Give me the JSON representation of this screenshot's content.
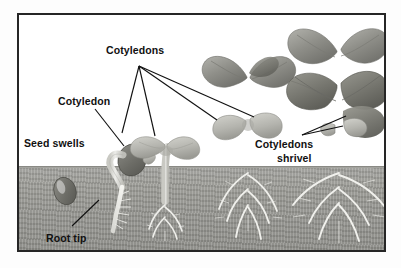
{
  "figure": {
    "frame": {
      "border_color": "#262626"
    },
    "colors": {
      "sky": "#ffffff",
      "soil": "#9d9d98",
      "leader_line": "#111111",
      "label_text": "#111111",
      "seed_dark": "#6f6f6a",
      "cotyledon": "#b9b9b3",
      "stem": "#e6e6e2",
      "leaf": "#9e9e98",
      "root": "#f2f2ee"
    },
    "soil_line_y": 152
  },
  "labels": [
    {
      "id": "cotyledons-top",
      "text": "Cotyledons",
      "x": 104,
      "y": 42,
      "lines": 1
    },
    {
      "id": "cotyledon-single",
      "text": "Cotyledon",
      "x": 56,
      "y": 93,
      "lines": 1
    },
    {
      "id": "seed-swells",
      "text": "Seed swells",
      "x": 22,
      "y": 135,
      "lines": 1
    },
    {
      "id": "root-tip",
      "text": "Root tip",
      "x": 44,
      "y": 230,
      "lines": 1
    },
    {
      "id": "cotyledons-shrivel",
      "text": "Cotyledons",
      "x": 253,
      "y": 136,
      "lines": 1
    },
    {
      "id": "shrivel",
      "text": "shrivel",
      "x": 275,
      "y": 150,
      "lines": 1
    }
  ],
  "leader_lines": [
    {
      "id": "cotyledons-to-stage3-left",
      "from": [
        137,
        64
      ],
      "to": [
        120,
        131
      ]
    },
    {
      "id": "cotyledons-to-stage3-right",
      "from": [
        137,
        64
      ],
      "to": [
        153,
        134
      ]
    },
    {
      "id": "cotyledons-to-stage4-left",
      "from": [
        137,
        64
      ],
      "to": [
        215,
        118
      ]
    },
    {
      "id": "cotyledons-to-stage4-right",
      "from": [
        137,
        64
      ],
      "to": [
        252,
        115
      ]
    },
    {
      "id": "cotyledon-to-seed",
      "from": [
        93,
        107
      ],
      "to": [
        122,
        144
      ]
    },
    {
      "id": "root-tip-to-root",
      "from": [
        70,
        224
      ],
      "to": [
        97,
        198
      ]
    },
    {
      "id": "shrivel-to-cotyledon-upper",
      "from": [
        300,
        133
      ],
      "to": [
        344,
        114
      ]
    },
    {
      "id": "shrivel-to-cotyledon-lower",
      "from": [
        300,
        133
      ],
      "to": [
        341,
        124
      ]
    }
  ],
  "stages": [
    {
      "id": "stage-1-dormant-seed",
      "caption": "Seed swells",
      "x": 45,
      "has_shoot": false,
      "has_root": false
    },
    {
      "id": "stage-2-germinating",
      "caption": "Cotyledon",
      "x": 115,
      "has_shoot": false,
      "has_root": true
    },
    {
      "id": "stage-3-seedling",
      "caption": "Cotyledons",
      "x": 165,
      "has_shoot": true,
      "has_root": true
    },
    {
      "id": "stage-4-young-plant",
      "caption": "Cotyledons",
      "x": 240,
      "has_shoot": true,
      "has_root": true
    },
    {
      "id": "stage-5-mature-plant",
      "caption": "Cotyledons shrivel",
      "x": 330,
      "has_shoot": true,
      "has_root": true
    }
  ]
}
